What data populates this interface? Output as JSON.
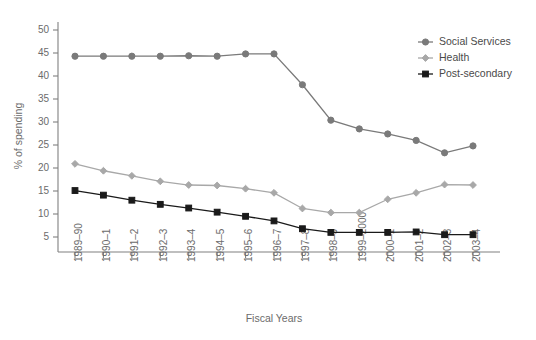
{
  "chart_data": {
    "type": "line",
    "title": "",
    "xlabel": "Fiscal Years",
    "ylabel": "% of spending",
    "grid": false,
    "legend_position": "top-right",
    "ylim": [
      0,
      52
    ],
    "yticks": [
      5,
      10,
      15,
      20,
      25,
      30,
      35,
      40,
      45,
      50
    ],
    "categories": [
      "1989–90",
      "1990–1",
      "1991–2",
      "1992–3",
      "1993–4",
      "1994–5",
      "1995–6",
      "1996–7",
      "1997–8",
      "1998–9",
      "1999–2000",
      "2000–1",
      "2001–2",
      "2002–3",
      "2003–4"
    ],
    "series": [
      {
        "name": "Social Services",
        "color": "#7a7a7a",
        "marker": "circle",
        "values": [
          44.3,
          44.3,
          44.3,
          44.3,
          44.4,
          44.3,
          44.8,
          44.8,
          38.1,
          30.4,
          28.5,
          27.4,
          26.0,
          23.3,
          24.8
        ]
      },
      {
        "name": "Health",
        "color": "#a8a8a8",
        "marker": "diamond",
        "values": [
          20.9,
          19.4,
          18.3,
          17.1,
          16.3,
          16.2,
          15.5,
          14.6,
          11.2,
          10.3,
          10.3,
          13.2,
          14.6,
          16.4,
          16.3
        ]
      },
      {
        "name": "Post-secondary",
        "color": "#1a1a1a",
        "marker": "square",
        "values": [
          15.1,
          14.1,
          13.0,
          12.1,
          11.3,
          10.4,
          9.5,
          8.5,
          6.8,
          6.0,
          6.0,
          6.0,
          6.1,
          5.5,
          5.5
        ]
      }
    ]
  },
  "legend": {
    "items": [
      {
        "label": "Social Services"
      },
      {
        "label": "Health"
      },
      {
        "label": "Post-secondary"
      }
    ]
  }
}
